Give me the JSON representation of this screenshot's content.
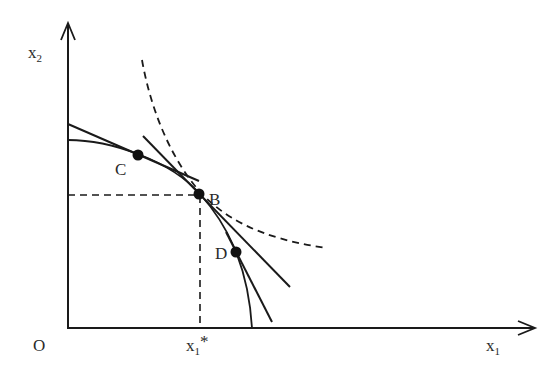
{
  "diagram": {
    "type": "economics-production-possibility-frontier",
    "axes": {
      "origin_label": "O",
      "x_label": "x",
      "x_label_sub": "1",
      "y_label": "x",
      "y_label_sub": "2",
      "x_star_label": "x",
      "x_star_sub": "1",
      "x_star_mark": "*"
    },
    "points": [
      {
        "id": "C",
        "label": "C"
      },
      {
        "id": "B",
        "label": "B"
      },
      {
        "id": "D",
        "label": "D"
      }
    ],
    "curves": {
      "frontier": "solid concave curve",
      "indifference": "dashed convex curve",
      "tangents": [
        "tangent at C",
        "tangent at B",
        "tangent at D"
      ],
      "guides": [
        "dashed horizontal from B to x2 axis",
        "dashed vertical from B to x1 axis"
      ]
    },
    "colors": {
      "line": "#1a1a1a",
      "background": "#ffffff"
    }
  }
}
